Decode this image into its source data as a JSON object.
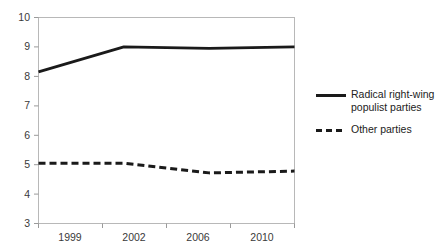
{
  "chart_data": {
    "type": "line",
    "title": "",
    "subtitle": "",
    "xlabel": "",
    "ylabel": "",
    "x": [
      1999,
      2002,
      2006,
      2010
    ],
    "tick_labels_x": [
      "1999",
      "2002",
      "2006",
      "2010"
    ],
    "tick_labels_y": [
      "10",
      "9",
      "8",
      "7",
      "6",
      "5",
      "4",
      "3"
    ],
    "ylim": [
      3,
      10
    ],
    "ytick_step": 1,
    "grid": false,
    "legend_position": "right",
    "series": [
      {
        "name": "Radical right-wing populist parties",
        "style": "solid",
        "color": "#1a1a1a",
        "values": [
          8.15,
          9.0,
          8.95,
          9.0
        ]
      },
      {
        "name": "Other parties",
        "style": "dashed",
        "color": "#1a1a1a",
        "values": [
          5.05,
          5.05,
          4.72,
          4.78
        ]
      }
    ]
  },
  "legend": {
    "entries": [
      {
        "label": "Radical right-wing\npopulist parties",
        "marker": "solid-line-icon"
      },
      {
        "label": "Other parties",
        "marker": "dashed-line-icon"
      }
    ]
  },
  "axes": {
    "y_ticks": [
      "10",
      "9",
      "8",
      "7",
      "6",
      "5",
      "4",
      "3"
    ],
    "x_ticks": [
      "1999",
      "2002",
      "2006",
      "2010"
    ]
  },
  "colors": {
    "series_line": "#1a1a1a",
    "axis": "#9a9a9a",
    "text": "#3a3a3a",
    "background": "#ffffff"
  }
}
